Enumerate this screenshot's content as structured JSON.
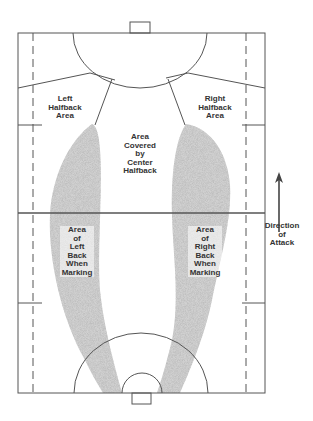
{
  "diagram": {
    "labels": {
      "left_halfback": "Left\nHalfback\nArea",
      "right_halfback": "Right\nHalfback\nArea",
      "center_halfback": "Area\nCovered\nby\nCenter\nHalfback",
      "left_back": "Area\nof\nLeft\nBack\nWhen\nMarking",
      "right_back": "Area\nof\nRight\nBack\nWhen\nMarking",
      "direction": "Direction\nof\nAttack"
    },
    "colors": {
      "line": "#555555",
      "shade": "#b8b8b8",
      "text": "#333333"
    }
  }
}
